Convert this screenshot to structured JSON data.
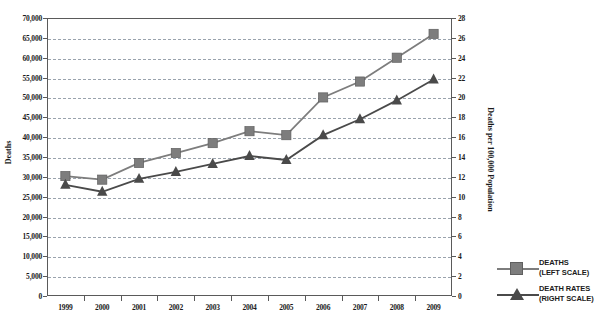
{
  "chart_data": {
    "type": "line",
    "title": "",
    "xlabel": "",
    "ylabel": "Deaths",
    "y2label": "Deaths per 100,000 Population",
    "categories": [
      "1999",
      "2000",
      "2001",
      "2002",
      "2003",
      "2004",
      "2005",
      "2006",
      "2007",
      "2008",
      "2009"
    ],
    "ylim": [
      0,
      70000
    ],
    "y2lim": [
      0,
      28
    ],
    "ytick_labels": [
      "0",
      "5,000",
      "10,000",
      "15,000",
      "20,000",
      "25,000",
      "30,000",
      "35,000",
      "40,000",
      "45,000",
      "50,000",
      "55,000",
      "60,000",
      "65,000",
      "70,000"
    ],
    "ytick_values": [
      0,
      5000,
      10000,
      15000,
      20000,
      25000,
      30000,
      35000,
      40000,
      45000,
      50000,
      55000,
      60000,
      65000,
      70000
    ],
    "y2tick_labels": [
      "0",
      "2",
      "4",
      "6",
      "8",
      "10",
      "12",
      "14",
      "16",
      "18",
      "20",
      "22",
      "24",
      "26",
      "28"
    ],
    "y2tick_values": [
      0,
      2,
      4,
      6,
      8,
      10,
      12,
      14,
      16,
      18,
      20,
      22,
      24,
      26,
      28
    ],
    "grid": true,
    "legend_position": "right",
    "series": [
      {
        "name": "DEATHS",
        "scale_label": "(LEFT SCALE)",
        "axis": "left",
        "marker": "square",
        "color": "#7d7d7d",
        "values": [
          30200,
          29300,
          33500,
          36000,
          38500,
          41500,
          40500,
          50000,
          54000,
          60000,
          66000
        ]
      },
      {
        "name": "DEATH RATES",
        "scale_label": "(RIGHT SCALE)",
        "axis": "right",
        "marker": "triangle",
        "color": "#4a4a4a",
        "values": [
          11.2,
          10.5,
          11.8,
          12.5,
          13.3,
          14.1,
          13.7,
          16.2,
          17.8,
          19.7,
          21.8
        ]
      }
    ]
  },
  "legend": {
    "items": [
      {
        "label": "DEATHS",
        "sublabel": "(LEFT SCALE)"
      },
      {
        "label": "DEATH RATES",
        "sublabel": "(RIGHT SCALE)"
      }
    ]
  },
  "colors": {
    "deaths": "#7d7d7d",
    "death_rates": "#4a4a4a",
    "grid": "#9aa3ad",
    "frame": "#5a5a5a"
  }
}
